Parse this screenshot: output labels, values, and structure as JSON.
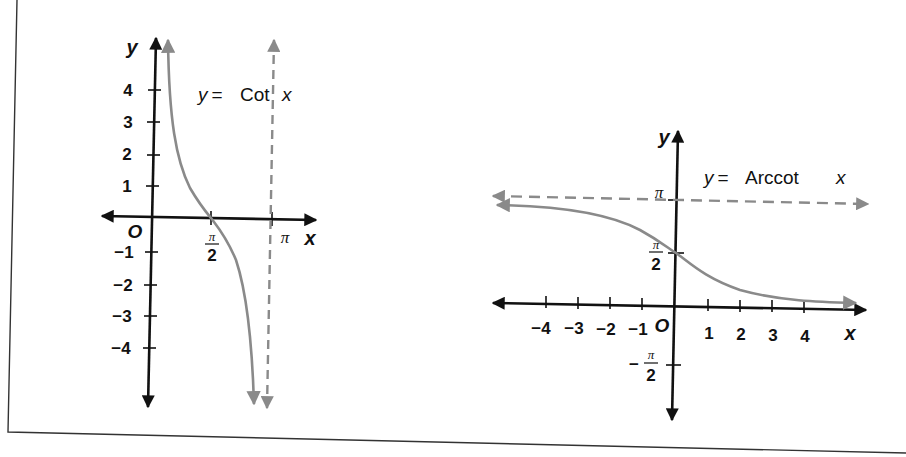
{
  "colors": {
    "axis": "#111111",
    "curve": "#8a8a8a",
    "asymptote": "#8a8a8a",
    "border": "#333333",
    "background": "#ffffff"
  },
  "left_graph": {
    "equation_prefix": "y = Cot",
    "equation_var": "x",
    "axis_x_label": "x",
    "axis_y_label": "y",
    "origin_label": "O",
    "y_ticks": [
      "4",
      "3",
      "2",
      "1",
      "−1",
      "−2",
      "−3",
      "−4"
    ],
    "x_ticks": {
      "half_pi_num": "π",
      "half_pi_den": "2",
      "pi": "π"
    },
    "asymptote": "x = π (dashed)"
  },
  "right_graph": {
    "equation_prefix": "y = Arccot",
    "equation_var": "x",
    "axis_x_label": "x",
    "axis_y_label": "y",
    "origin_label": "O",
    "x_ticks": [
      "−4",
      "−3",
      "−2",
      "−1",
      "1",
      "2",
      "3",
      "4"
    ],
    "y_ticks": {
      "pi": "π",
      "half_pi_num": "π",
      "half_pi_den": "2",
      "neg_half_pi_sign": "−",
      "neg_half_pi_num": "π",
      "neg_half_pi_den": "2"
    },
    "asymptote": "y = π (dashed)"
  }
}
